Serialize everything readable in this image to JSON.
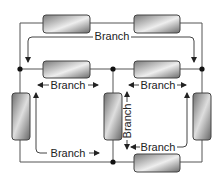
{
  "diagram": {
    "type": "series-parallel circuit branches",
    "labels": {
      "top_branch": "Branch",
      "middle_left_branch": "Branch",
      "middle_right_branch": "Branch",
      "vertical_center_branch": "Branch",
      "bottom_left_branch": "Branch",
      "bottom_right_branch": "Branch"
    },
    "components": [
      {
        "id": "r-top-left",
        "orientation": "horizontal"
      },
      {
        "id": "r-top-right",
        "orientation": "horizontal"
      },
      {
        "id": "r-mid-left",
        "orientation": "horizontal"
      },
      {
        "id": "r-mid-right",
        "orientation": "horizontal"
      },
      {
        "id": "r-left-vertical",
        "orientation": "vertical"
      },
      {
        "id": "r-center-vertical",
        "orientation": "vertical"
      },
      {
        "id": "r-right-vertical",
        "orientation": "vertical"
      },
      {
        "id": "r-bottom",
        "orientation": "horizontal"
      }
    ],
    "colors": {
      "wire": "#555555",
      "node": "#111111",
      "resistor_dark": "#6e6e6e",
      "resistor_light": "#e8e8e8"
    }
  }
}
